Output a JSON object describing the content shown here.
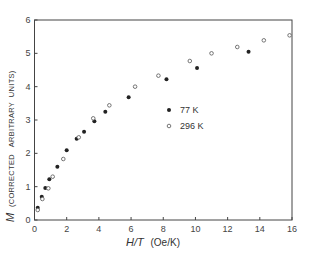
{
  "chart_data": {
    "type": "scatter",
    "title": "",
    "xlabel": "H/T (Oe/K)",
    "ylabel": "M (CORRECTED ARBITRARY UNITS)",
    "ylabel_symbol": "M",
    "ylabel_rest": "(CORRECTED   ARBITRARY  UNITS)",
    "xlabel_symbol": "H/T",
    "xlabel_rest": "(Oe/K)",
    "xlim": [
      0,
      16
    ],
    "ylim": [
      0,
      6
    ],
    "xticks": [
      0,
      2,
      4,
      6,
      8,
      10,
      12,
      14,
      16
    ],
    "xtick_labels": [
      "0",
      "2",
      "4",
      "6",
      "8",
      "10",
      "12",
      "14",
      "16"
    ],
    "yticks": [
      0,
      1,
      2,
      3,
      4,
      5,
      6
    ],
    "ytick_labels": [
      "0",
      "1",
      "2",
      "3",
      "4",
      "5",
      "6"
    ],
    "grid": false,
    "legend_position": "inside center",
    "series": [
      {
        "name": "77 K",
        "marker": "filled-circle",
        "color": "#222222",
        "points": [
          [
            0.2,
            0.37
          ],
          [
            0.45,
            0.7
          ],
          [
            0.67,
            0.96
          ],
          [
            0.92,
            1.22
          ],
          [
            1.42,
            1.6
          ],
          [
            2.0,
            2.09
          ],
          [
            2.62,
            2.44
          ],
          [
            3.08,
            2.65
          ],
          [
            3.72,
            2.96
          ],
          [
            4.4,
            3.25
          ],
          [
            5.85,
            3.68
          ],
          [
            8.2,
            4.22
          ],
          [
            10.1,
            4.56
          ],
          [
            13.3,
            5.05
          ]
        ]
      },
      {
        "name": "296 K",
        "marker": "open-circle",
        "color": "#555555",
        "points": [
          [
            0.2,
            0.3
          ],
          [
            0.49,
            0.63
          ],
          [
            0.86,
            0.95
          ],
          [
            1.13,
            1.3
          ],
          [
            1.79,
            1.83
          ],
          [
            2.75,
            2.48
          ],
          [
            3.65,
            3.05
          ],
          [
            4.65,
            3.44
          ],
          [
            6.25,
            4.0
          ],
          [
            7.7,
            4.33
          ],
          [
            9.65,
            4.77
          ],
          [
            11.0,
            5.0
          ],
          [
            12.6,
            5.19
          ],
          [
            14.25,
            5.39
          ],
          [
            15.85,
            5.54
          ]
        ]
      }
    ]
  }
}
